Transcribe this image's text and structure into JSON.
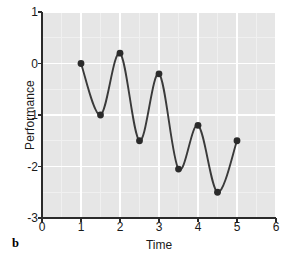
{
  "panel": {
    "label": "b"
  },
  "chart_data": {
    "type": "line",
    "title": "",
    "xlabel": "Time",
    "ylabel": "Performance",
    "xlim": [
      0,
      6
    ],
    "ylim": [
      -3,
      1
    ],
    "xticks": [
      0,
      1,
      2,
      3,
      4,
      5,
      6
    ],
    "xtick_labels": [
      "0",
      "1",
      "2",
      "3",
      "4",
      "5",
      "6"
    ],
    "yticks": [
      1,
      0,
      -1,
      -2,
      -3
    ],
    "ytick_labels": [
      "1",
      "0",
      "-1",
      "-2",
      "-3"
    ],
    "grid": true,
    "grid_color": "#ffffff",
    "minor_grid": true,
    "minor_xstep": 0.5,
    "minor_ystep": 0.5,
    "plot_background": "#e6e6e6",
    "legend": null,
    "series": [
      {
        "name": "Performance",
        "line_color": "#3a3a3a",
        "marker": "circle",
        "marker_color": "#2b2b2b",
        "x": [
          1,
          1.5,
          2,
          2.5,
          3,
          3.5,
          4,
          4.5,
          5
        ],
        "y": [
          0.0,
          -1.0,
          0.2,
          -1.5,
          -0.2,
          -2.05,
          -1.2,
          -2.5,
          -1.5
        ]
      }
    ]
  }
}
